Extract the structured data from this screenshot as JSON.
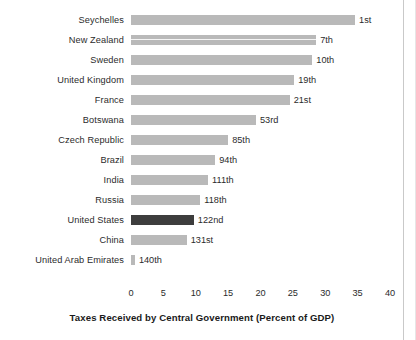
{
  "chart_data": {
    "type": "bar",
    "orientation": "horizontal",
    "title": "",
    "xlabel": "Taxes Received by Central Government (Percent of GDP)",
    "ylabel": "",
    "xlim": [
      0,
      40
    ],
    "xticks": [
      "0",
      "5",
      "10",
      "15",
      "20",
      "25",
      "30",
      "35",
      "40"
    ],
    "xtick_values": [
      0,
      5,
      10,
      15,
      20,
      25,
      30,
      35,
      40
    ],
    "grid": false,
    "legend": false,
    "categories": [
      "Seychelles",
      "New Zealand",
      "Sweden",
      "United Kingdom",
      "France",
      "Botswana",
      "Czech Republic",
      "Brazil",
      "India",
      "Russia",
      "United States",
      "China",
      "United Arab Emirates"
    ],
    "values": [
      34.6,
      28.6,
      28.0,
      25.2,
      24.5,
      19.3,
      15.0,
      13.0,
      11.9,
      10.7,
      9.7,
      8.6,
      0.6
    ],
    "point_labels": [
      "1st",
      "7th",
      "10th",
      "19th",
      "21st",
      "53rd",
      "85th",
      "94th",
      "111th",
      "118th",
      "122nd",
      "131st",
      "140th"
    ],
    "highlight_category": "United States",
    "colors": {
      "bar": "#b9b9b9",
      "bar_highlight": "#3d3d3d",
      "text": "#2b2b2b",
      "background": "#ffffff"
    }
  }
}
